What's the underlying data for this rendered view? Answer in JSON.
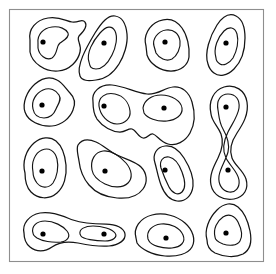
{
  "figure": {
    "type": "contour-blob-map",
    "title": "",
    "caption": "",
    "width": 276,
    "height": 274,
    "background_color": "#ffffff",
    "line_color": "#141414",
    "frame_color": "#8e8e8e",
    "dot_color": "#000000",
    "frame": {
      "x": 9,
      "y": 9,
      "width": 254,
      "height": 252
    },
    "blob_count": 15,
    "dot_count": 18,
    "dot_radius": 2.6
  },
  "chart_data": {
    "type": "contour",
    "title": "",
    "xlabel": "",
    "ylabel": "",
    "grid": false,
    "legend": "none",
    "xlim": [
      9,
      263
    ],
    "ylim": [
      9,
      261
    ],
    "blobs": [
      {
        "id": "blob-r1c1",
        "levels": 2,
        "peaks": [
          [
            43,
            42
          ]
        ],
        "outer": "M 30,40 C 28,29 36,20 48,18 C 59,16 66,21 72,22 C 79,23 82,18 85,22 C 88,26 83,32 79,36 C 76,40 82,44 80,52 C 78,61 70,70 58,71 C 45,72 32,63 30,52 Z",
        "inner": "M 38,43 C 37,35 43,28 52,27 C 60,26 66,29 68,33 C 70,37 64,40 60,43 C 56,46 58,54 52,58 C 46,61 39,55 38,48 Z"
      },
      {
        "id": "blob-r1c2",
        "levels": 2,
        "peaks": [
          [
            104,
            43
          ]
        ],
        "outer": "M 80,76 C 76,66 86,48 95,33 C 102,22 108,15 115,16 C 122,17 126,24 127,34 C 128,44 124,56 119,64 C 114,72 106,79 96,80 C 88,81 82,81 80,76 Z",
        "inner": "M 89,62 C 86,53 93,41 100,33 C 106,26 112,25 115,31 C 118,37 116,47 112,55 C 108,63 102,69 96,69 C 91,69 90,67 89,62 Z"
      },
      {
        "id": "blob-r1c3",
        "levels": 2,
        "peaks": [
          [
            165,
            42
          ]
        ],
        "outer": "M 146,46 C 143,36 149,25 159,21 C 169,17 177,21 182,28 C 187,35 190,47 189,57 C 188,65 181,71 171,71 C 160,71 150,64 147,55 Z",
        "inner": "M 154,46 C 152,39 158,31 166,30 C 174,29 179,34 180,41 C 181,48 177,56 172,59 C 166,62 159,58 156,53 Z"
      },
      {
        "id": "blob-r1c4",
        "levels": 2,
        "peaks": [
          [
            226,
            43
          ]
        ],
        "outer": "M 208,64 C 204,53 210,36 217,25 C 223,16 230,13 236,16 C 242,19 245,27 245,38 C 245,50 241,62 234,69 C 227,76 219,77 214,73 C 210,70 209,68 208,64 Z",
        "inner": "M 216,58 C 213,48 218,37 224,31 C 229,26 235,27 237,34 C 239,41 237,51 233,58 C 229,64 223,66 220,64 C 217,62 216,61 216,58 Z"
      },
      {
        "id": "blob-r2c1",
        "levels": 2,
        "peaks": [
          [
            42,
            105
          ]
        ],
        "outer": "M 25,112 C 22,103 27,91 35,84 C 42,78 50,76 57,80 C 63,83 66,89 70,93 C 74,97 76,103 73,110 C 70,118 62,125 52,126 C 40,127 28,121 25,112 Z",
        "inner": "M 33,109 C 31,101 36,93 43,90 C 50,87 56,90 59,95 C 62,100 58,104 56,109 C 54,114 50,118 44,118 C 37,118 34,114 33,109 Z"
      },
      {
        "id": "blob-r2c2",
        "levels": 2,
        "peaks": [
          [
            104,
            106
          ],
          [
            164,
            108
          ]
        ],
        "outer": "M 93,102 C 91,92 100,84 112,85 C 124,86 136,93 147,94 C 158,95 164,88 173,87 C 182,86 189,92 192,102 C 195,112 195,124 190,133 C 185,142 176,146 168,144 C 160,142 157,135 153,134 C 149,133 148,139 143,138 C 138,137 136,130 132,129 C 128,128 126,132 120,132 C 112,132 103,127 97,119 C 93,113 93,107 93,102 Z",
        "inner": "M 99,106 C 98,97 106,92 115,94 C 124,96 129,103 130,111 C 131,118 125,124 117,124 C 108,124 100,115 99,106 Z",
        "inner2": "M 143,108 C 144,100 152,95 161,95 C 172,95 181,101 182,108 C 183,115 176,120 167,121 C 157,122 147,118 144,113 Z"
      },
      {
        "id": "blob-r2c3-tall",
        "levels": 2,
        "peaks": [
          [
            226,
            107
          ],
          [
            228,
            170
          ]
        ],
        "outer": "M 211,114 C 208,101 214,90 224,87 C 235,84 245,90 247,102 C 249,114 243,124 237,133 C 231,142 229,150 232,158 C 235,166 243,170 246,179 C 249,189 244,197 234,199 C 223,201 213,195 211,185 C 209,175 214,166 218,158 C 222,150 224,142 221,134 C 218,126 212,122 211,114 Z",
        "inner": "M 218,110 C 216,100 221,94 228,94 C 236,94 240,100 239,108 C 238,116 232,124 228,132 C 224,140 222,150 226,158 C 230,166 238,172 239,180 C 240,188 235,193 229,192 C 222,191 218,184 219,176 C 220,168 226,160 228,152 C 230,144 227,136 223,129 C 219,122 219,116 218,110 Z"
      },
      {
        "id": "blob-r3c1",
        "levels": 2,
        "peaks": [
          [
            42,
            171
          ]
        ],
        "outer": "M 25,173 C 22,162 26,150 34,143 C 41,137 50,136 56,141 C 62,146 65,155 66,165 C 67,176 64,187 57,193 C 49,200 38,199 31,192 C 26,187 25,180 25,173 Z",
        "inner": "M 33,172 C 31,162 35,153 42,150 C 49,147 55,151 57,159 C 59,167 57,177 53,183 C 48,189 41,188 37,183 C 34,179 33,176 33,172 Z"
      },
      {
        "id": "blob-r3c2",
        "levels": 2,
        "peaks": [
          [
            105,
            171
          ]
        ],
        "outer": "M 78,145 C 82,139 89,139 96,142 C 103,145 109,151 117,155 C 125,159 135,161 141,167 C 147,173 148,182 143,189 C 138,196 128,199 117,198 C 105,197 95,192 89,185 C 83,178 80,170 79,161 C 78,154 76,149 78,145 Z",
        "inner": "M 92,170 C 90,160 95,152 103,151 C 111,150 120,156 126,163 C 132,170 133,178 128,183 C 123,188 113,188 105,184 C 97,180 93,176 92,170 Z"
      },
      {
        "id": "blob-r3c3",
        "levels": 2,
        "peaks": [
          [
            165,
            170
          ]
        ],
        "outer": "M 155,163 C 152,154 157,147 165,146 C 173,145 179,150 184,158 C 189,166 194,176 193,186 C 192,196 185,202 177,201 C 169,200 164,193 161,185 C 158,177 157,170 155,163 Z",
        "inner": "M 161,168 C 159,161 163,156 169,157 C 175,158 179,164 182,172 C 185,180 186,188 182,192 C 178,196 172,193 169,187 C 166,181 163,174 161,168 Z"
      },
      {
        "id": "blob-r4c1",
        "levels": 2,
        "peaks": [
          [
            43,
            234
          ],
          [
            104,
            234
          ]
        ],
        "outer": "M 24,233 C 22,224 29,215 40,213 C 51,211 62,216 73,220 C 84,224 96,224 106,224 C 116,224 124,228 125,234 C 126,240 119,245 109,246 C 99,247 88,245 78,243 C 68,241 59,242 52,247 C 45,252 36,252 30,247 C 25,243 24,238 24,233 Z",
        "inner": "M 33,233 C 31,226 37,221 45,221 C 54,221 63,226 67,231 C 71,236 68,241 61,242 C 52,243 42,241 37,238 C 34,236 33,235 33,233 Z",
        "inner2": "M 80,234 C 79,229 85,226 93,226 C 102,226 112,229 115,233 C 118,237 113,241 105,241 C 95,241 83,239 81,236 Z"
      },
      {
        "id": "blob-r4c2",
        "levels": 2,
        "peaks": [
          [
            166,
            238
          ]
        ],
        "outer": "M 136,238 C 133,228 140,218 152,215 C 164,212 177,216 185,223 C 193,230 196,240 192,247 C 188,254 177,257 165,256 C 152,255 141,249 137,243 Z",
        "inner": "M 148,239 C 146,231 152,225 161,224 C 171,223 180,228 183,235 C 186,242 181,247 172,248 C 162,249 151,245 149,241 Z"
      },
      {
        "id": "blob-r4c3",
        "levels": 2,
        "peaks": [
          [
            226,
            233
          ]
        ],
        "outer": "M 207,240 C 204,230 209,218 217,210 C 224,203 232,202 238,207 C 244,212 248,221 250,231 C 252,241 250,250 243,254 C 235,258 224,257 215,253 C 209,250 207,245 207,240 Z",
        "inner": "M 215,237 C 213,229 217,221 223,217 C 229,213 235,216 238,222 C 241,228 243,236 240,241 C 237,246 229,246 223,244 C 218,242 215,240 215,237 Z"
      }
    ]
  }
}
